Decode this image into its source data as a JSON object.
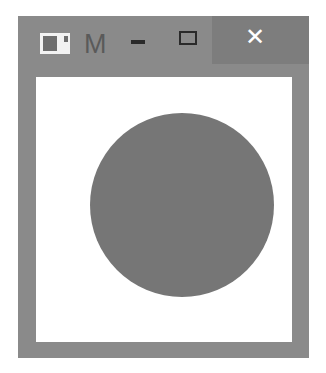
{
  "window": {
    "title": "M",
    "app_icon": "window-app-icon",
    "controls": {
      "minimize": {
        "icon": "minimize-icon",
        "glyph": ""
      },
      "maximize": {
        "icon": "maximize-icon",
        "glyph": ""
      },
      "close": {
        "icon": "close-icon",
        "glyph": "✕"
      }
    }
  },
  "canvas": {
    "background": "#ffffff",
    "shape": {
      "type": "circle",
      "color": "#767676",
      "left": 54,
      "top": 36,
      "diameter": 184
    }
  },
  "colors": {
    "frame": "#8a8a8a",
    "close_hover": "#7d7d7d"
  }
}
